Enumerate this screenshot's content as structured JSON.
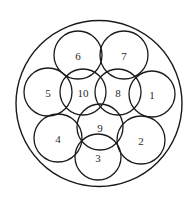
{
  "diagram": {
    "type": "circle-packing",
    "stroke_color": "#1a1a1a",
    "label_color": "#2a2a2a",
    "background": "#ffffff",
    "outer_circle": {
      "cx": 99,
      "cy": 103.5,
      "r": 83
    },
    "circles": [
      {
        "label": "1",
        "cx": 152,
        "cy": 94,
        "r": 23
      },
      {
        "label": "2",
        "cx": 141,
        "cy": 140,
        "r": 24
      },
      {
        "label": "3",
        "cx": 98,
        "cy": 157,
        "r": 23
      },
      {
        "label": "4",
        "cx": 58,
        "cy": 138,
        "r": 24
      },
      {
        "label": "5",
        "cx": 48,
        "cy": 92,
        "r": 24
      },
      {
        "label": "6",
        "cx": 78,
        "cy": 55,
        "r": 24
      },
      {
        "label": "7",
        "cx": 124,
        "cy": 55,
        "r": 24
      },
      {
        "label": "8",
        "cx": 118,
        "cy": 92,
        "r": 23
      },
      {
        "label": "9",
        "cx": 100,
        "cy": 127,
        "r": 23
      },
      {
        "label": "10",
        "cx": 83,
        "cy": 92,
        "r": 23
      }
    ]
  }
}
